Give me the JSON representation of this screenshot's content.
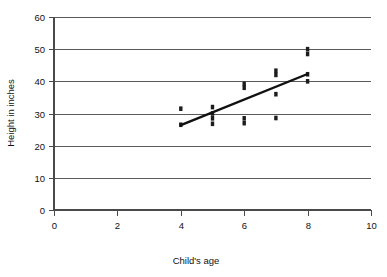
{
  "chart_data": {
    "type": "scatter",
    "title": "",
    "xlabel": "Child's age",
    "ylabel": "Height in inches",
    "xlim": [
      0,
      10
    ],
    "ylim": [
      0,
      60
    ],
    "xticks": [
      0,
      2,
      4,
      6,
      8,
      10
    ],
    "yticks": [
      0,
      10,
      20,
      30,
      40,
      50,
      60
    ],
    "xtick_labels": [
      "0",
      "2",
      "4",
      "6",
      "8",
      "10"
    ],
    "ytick_labels": [
      "0",
      "10",
      "20",
      "30",
      "40",
      "50",
      "60"
    ],
    "grid": "horizontal",
    "legend": "none",
    "marker": "small-filled-square",
    "marker_color": "#1c1c1c",
    "points": [
      {
        "x": 4,
        "y": 31.5
      },
      {
        "x": 4,
        "y": 26.5
      },
      {
        "x": 5,
        "y": 32.0
      },
      {
        "x": 5,
        "y": 30.0
      },
      {
        "x": 5,
        "y": 28.5
      },
      {
        "x": 5,
        "y": 26.8
      },
      {
        "x": 6,
        "y": 39.2
      },
      {
        "x": 6,
        "y": 38.0
      },
      {
        "x": 6,
        "y": 28.5
      },
      {
        "x": 6,
        "y": 27.0
      },
      {
        "x": 7,
        "y": 43.3
      },
      {
        "x": 7,
        "y": 42.0
      },
      {
        "x": 7,
        "y": 36.0
      },
      {
        "x": 7,
        "y": 28.6
      },
      {
        "x": 8,
        "y": 50.0
      },
      {
        "x": 8,
        "y": 48.5
      },
      {
        "x": 8,
        "y": 42.2
      },
      {
        "x": 8,
        "y": 40.0
      }
    ],
    "trendline": {
      "type": "line",
      "x_start": 4,
      "y_start": 26.4,
      "x_end": 8,
      "y_end": 42.3
    }
  },
  "axis_titles": {
    "x": "Child's age",
    "y": "Height in inches"
  }
}
